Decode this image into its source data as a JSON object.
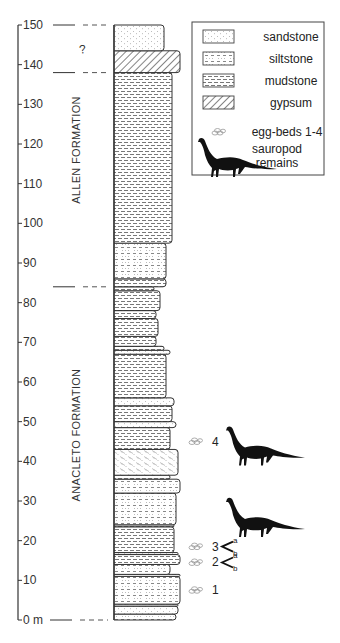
{
  "chart_data": {
    "type": "stratigraphic-column",
    "axis": {
      "min": 0,
      "max": 150,
      "step": 10,
      "unit": "m",
      "ticks": [
        0,
        10,
        20,
        30,
        40,
        50,
        60,
        70,
        80,
        90,
        100,
        110,
        120,
        130,
        140,
        150
      ],
      "zero_label": "0 m"
    },
    "formations": [
      {
        "name": "ALLEN FORMATION",
        "bottom": 84,
        "top": 138
      },
      {
        "name": "ANACLETO FORMATION",
        "bottom": 0,
        "top": 84
      }
    ],
    "uncertain_interval": {
      "bottom": 138,
      "top": 150,
      "label": "?"
    },
    "boundaries": [
      0,
      84,
      138,
      150
    ],
    "layers": [
      {
        "bottom": 0,
        "top": 1.5,
        "lith": "siltstone",
        "w": 62
      },
      {
        "bottom": 1.5,
        "top": 3.5,
        "lith": "sandstone",
        "w": 64
      },
      {
        "bottom": 3.5,
        "top": 4,
        "lith": "mudstone",
        "w": 64
      },
      {
        "bottom": 4,
        "top": 11,
        "lith": "siltstone",
        "w": 66
      },
      {
        "bottom": 11,
        "top": 11.5,
        "lith": "mudstone",
        "w": 66
      },
      {
        "bottom": 11.5,
        "top": 14,
        "lith": "siltstone",
        "w": 56
      },
      {
        "bottom": 14,
        "top": 16.5,
        "lith": "mudstone",
        "w": 66
      },
      {
        "bottom": 16.5,
        "top": 17,
        "lith": "sandstone",
        "w": 64
      },
      {
        "bottom": 17,
        "top": 23.5,
        "lith": "mudstone",
        "w": 60
      },
      {
        "bottom": 23.5,
        "top": 24,
        "lith": "mudstone",
        "w": 60
      },
      {
        "bottom": 24,
        "top": 32,
        "lith": "siltstone",
        "w": 62
      },
      {
        "bottom": 32,
        "top": 35.5,
        "lith": "siltstone",
        "w": 66
      },
      {
        "bottom": 35.5,
        "top": 36.5,
        "lith": "mudstone",
        "w": 56
      },
      {
        "bottom": 36.5,
        "top": 43,
        "lith": "crossbedded-sandstone",
        "w": 64
      },
      {
        "bottom": 43,
        "top": 48.5,
        "lith": "mudstone",
        "w": 56
      },
      {
        "bottom": 48.5,
        "top": 50,
        "lith": "sandstone",
        "w": 62
      },
      {
        "bottom": 50,
        "top": 54,
        "lith": "mudstone",
        "w": 58
      },
      {
        "bottom": 54,
        "top": 56,
        "lith": "sandstone",
        "w": 60
      },
      {
        "bottom": 56,
        "top": 67,
        "lith": "mudstone",
        "w": 52
      },
      {
        "bottom": 67,
        "top": 68,
        "lith": "sandstone",
        "w": 56
      },
      {
        "bottom": 68,
        "top": 69,
        "lith": "mudstone",
        "w": 50
      },
      {
        "bottom": 69,
        "top": 71.5,
        "lith": "mudstone",
        "w": 42
      },
      {
        "bottom": 71.5,
        "top": 76,
        "lith": "mudstone",
        "w": 44
      },
      {
        "bottom": 76,
        "top": 78,
        "lith": "mudstone",
        "w": 42
      },
      {
        "bottom": 78,
        "top": 83,
        "lith": "mudstone",
        "w": 46
      },
      {
        "bottom": 83,
        "top": 84,
        "lith": "mudstone",
        "w": 40
      },
      {
        "bottom": 84,
        "top": 86,
        "lith": "mudstone",
        "w": 52
      },
      {
        "bottom": 86,
        "top": 95,
        "lith": "siltstone",
        "w": 52
      },
      {
        "bottom": 95,
        "top": 138,
        "lith": "mudstone",
        "w": 58
      },
      {
        "bottom": 138,
        "top": 143.5,
        "lith": "gypsum",
        "w": 66
      },
      {
        "bottom": 143.5,
        "top": 150,
        "lith": "sandstone",
        "w": 50
      }
    ],
    "egg_beds": [
      {
        "label": "1",
        "y": 7.5
      },
      {
        "label": "2",
        "y": 14.5,
        "sub": [
          "a",
          "b"
        ]
      },
      {
        "label": "3",
        "y": 18.5,
        "sub": [
          "a",
          "b"
        ]
      },
      {
        "label": "4",
        "y": 45
      }
    ],
    "sauropod_remains": [
      {
        "y": 45
      },
      {
        "y": 27
      }
    ]
  },
  "legend": {
    "items": [
      {
        "key": "sandstone",
        "label": "sandstone"
      },
      {
        "key": "siltstone",
        "label": "siltstone"
      },
      {
        "key": "mudstone",
        "label": "mudstone"
      },
      {
        "key": "gypsum",
        "label": "gypsum"
      },
      {
        "key": "egg",
        "label": "egg-beds 1-4"
      },
      {
        "key": "sauropod",
        "label": "sauropod",
        "label2": "remains"
      }
    ]
  },
  "colors": {
    "line": "#333333",
    "fill": "#ffffff",
    "egg": "#999999",
    "sauropod": "#111111"
  }
}
